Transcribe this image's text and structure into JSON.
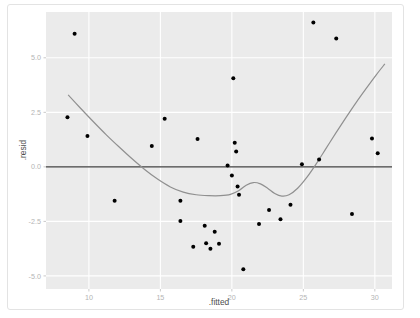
{
  "chart_data": {
    "type": "scatter",
    "title": "",
    "xlabel": ".fitted",
    "ylabel": ".resid",
    "xlim": [
      7.0,
      31.2
    ],
    "ylim": [
      -5.6,
      7.1
    ],
    "xticks": [
      10,
      15,
      20,
      25,
      30
    ],
    "xticklabels": [
      "10",
      "15",
      "20",
      "25",
      "30"
    ],
    "yticks": [
      5.0,
      2.5,
      0.0,
      -2.5,
      -5.0
    ],
    "yticklabels": [
      "5.0",
      "2.5",
      "0.0",
      "-2.5",
      "-5.0"
    ],
    "grid": true,
    "grid_color": "#ffffff",
    "panel_background": "#ebebeb",
    "point_color": "#000000",
    "point_size": 2.0,
    "legend": "none",
    "reference_line": {
      "type": "horizontal",
      "y": 0.0,
      "color": "#3d3d3d",
      "width": 1.4
    },
    "smoother": {
      "type": "loess",
      "color": "#909090",
      "width": 1.2,
      "points": [
        [
          8.55,
          3.3
        ],
        [
          9.4,
          2.7
        ],
        [
          10.3,
          2.08
        ],
        [
          11.2,
          1.48
        ],
        [
          12.1,
          0.92
        ],
        [
          13.0,
          0.38
        ],
        [
          13.9,
          -0.12
        ],
        [
          14.8,
          -0.56
        ],
        [
          15.7,
          -0.92
        ],
        [
          16.6,
          -1.16
        ],
        [
          17.5,
          -1.28
        ],
        [
          18.4,
          -1.32
        ],
        [
          19.2,
          -1.32
        ],
        [
          19.9,
          -1.26
        ],
        [
          20.5,
          -1.08
        ],
        [
          21.0,
          -0.84
        ],
        [
          21.5,
          -0.72
        ],
        [
          22.0,
          -0.78
        ],
        [
          22.5,
          -0.98
        ],
        [
          23.0,
          -1.22
        ],
        [
          23.5,
          -1.34
        ],
        [
          24.0,
          -1.28
        ],
        [
          24.6,
          -0.98
        ],
        [
          25.2,
          -0.52
        ],
        [
          25.9,
          0.14
        ],
        [
          26.6,
          0.86
        ],
        [
          27.3,
          1.58
        ],
        [
          28.0,
          2.28
        ],
        [
          28.7,
          2.96
        ],
        [
          29.4,
          3.6
        ],
        [
          30.1,
          4.22
        ],
        [
          30.7,
          4.72
        ]
      ]
    },
    "points": [
      {
        "x": 9.0,
        "y": 6.1
      },
      {
        "x": 8.5,
        "y": 2.28
      },
      {
        "x": 9.9,
        "y": 1.42
      },
      {
        "x": 11.8,
        "y": -1.55
      },
      {
        "x": 14.4,
        "y": 0.96
      },
      {
        "x": 15.3,
        "y": 2.2
      },
      {
        "x": 16.4,
        "y": -1.55
      },
      {
        "x": 16.4,
        "y": -2.48
      },
      {
        "x": 17.3,
        "y": -3.66
      },
      {
        "x": 17.6,
        "y": 1.28
      },
      {
        "x": 18.1,
        "y": -2.7
      },
      {
        "x": 18.2,
        "y": -3.5
      },
      {
        "x": 18.5,
        "y": -3.76
      },
      {
        "x": 18.8,
        "y": -2.98
      },
      {
        "x": 19.1,
        "y": -3.52
      },
      {
        "x": 19.7,
        "y": 0.06
      },
      {
        "x": 20.0,
        "y": -0.4
      },
      {
        "x": 20.1,
        "y": 4.06
      },
      {
        "x": 20.2,
        "y": 1.1
      },
      {
        "x": 20.3,
        "y": 0.7
      },
      {
        "x": 20.4,
        "y": -0.9
      },
      {
        "x": 20.5,
        "y": -1.28
      },
      {
        "x": 20.8,
        "y": -4.7
      },
      {
        "x": 21.9,
        "y": -2.62
      },
      {
        "x": 22.6,
        "y": -1.98
      },
      {
        "x": 23.4,
        "y": -2.4
      },
      {
        "x": 24.1,
        "y": -1.74
      },
      {
        "x": 24.9,
        "y": 0.12
      },
      {
        "x": 25.7,
        "y": 6.62
      },
      {
        "x": 26.1,
        "y": 0.34
      },
      {
        "x": 27.3,
        "y": 5.88
      },
      {
        "x": 29.8,
        "y": 1.3
      },
      {
        "x": 30.2,
        "y": 0.62
      },
      {
        "x": 28.4,
        "y": -2.16
      }
    ]
  }
}
